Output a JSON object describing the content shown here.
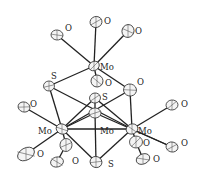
{
  "figure": {
    "type": "ORTEP molecular structure",
    "atoms": [
      {
        "id": "Mo1",
        "el": "Mo",
        "x": 94,
        "y": 66,
        "rx": 5.5,
        "ry": 4.5,
        "label": "Mo",
        "lx": 100,
        "ly": 70
      },
      {
        "id": "O1",
        "el": "O",
        "x": 57,
        "y": 35,
        "rx": 6,
        "ry": 5,
        "label": "O",
        "lx": 65,
        "ly": 31
      },
      {
        "id": "O2",
        "el": "O",
        "x": 96,
        "y": 22,
        "rx": 6,
        "ry": 5.5,
        "label": "O",
        "lx": 104,
        "ly": 24
      },
      {
        "id": "O3",
        "el": "O",
        "x": 128,
        "y": 31,
        "rx": 6,
        "ry": 6.5,
        "label": "O",
        "lx": 135,
        "ly": 34
      },
      {
        "id": "S1",
        "el": "S",
        "x": 49,
        "y": 86,
        "rx": 5.5,
        "ry": 5,
        "label": "S",
        "lx": 51,
        "ly": 79
      },
      {
        "id": "O4",
        "el": "O",
        "x": 97,
        "y": 81,
        "rx": 6,
        "ry": 6,
        "label": "O",
        "lx": 105,
        "ly": 86
      },
      {
        "id": "O5",
        "el": "O",
        "x": 130,
        "y": 90,
        "rx": 6.5,
        "ry": 6,
        "label": "O",
        "lx": 137,
        "ly": 85
      },
      {
        "id": "S2",
        "el": "S",
        "x": 95,
        "y": 98,
        "rx": 5.5,
        "ry": 5,
        "label": "S",
        "lx": 102,
        "ly": 100
      },
      {
        "id": "Mo2",
        "el": "Mo",
        "x": 62,
        "y": 129,
        "rx": 6,
        "ry": 5,
        "label": "Mo",
        "lx": 38,
        "ly": 134
      },
      {
        "id": "Mo3",
        "el": "Mo",
        "x": 95,
        "y": 113,
        "rx": 6,
        "ry": 5,
        "label": "Mo",
        "lx": 100,
        "ly": 134
      },
      {
        "id": "Mo4",
        "el": "Mo",
        "x": 132,
        "y": 129,
        "rx": 6,
        "ry": 5,
        "label": "Mo",
        "lx": 138,
        "ly": 134
      },
      {
        "id": "O6",
        "el": "O",
        "x": 24,
        "y": 107,
        "rx": 6,
        "ry": 5,
        "label": "O",
        "lx": 30,
        "ly": 107
      },
      {
        "id": "O7",
        "el": "O",
        "x": 172,
        "y": 105,
        "rx": 6,
        "ry": 5,
        "label": "O",
        "lx": 181,
        "ly": 107
      },
      {
        "id": "O8",
        "el": "O",
        "x": 26,
        "y": 154,
        "rx": 9,
        "ry": 6,
        "label": "O",
        "lx": 37,
        "ly": 157
      },
      {
        "id": "O9",
        "el": "O",
        "x": 66,
        "y": 145,
        "rx": 6,
        "ry": 6.5,
        "label": "O",
        "lx": 0,
        "ly": 0
      },
      {
        "id": "O10",
        "el": "O",
        "x": 57,
        "y": 162,
        "rx": 6.5,
        "ry": 5,
        "label": "O",
        "lx": 72,
        "ly": 164
      },
      {
        "id": "S3",
        "el": "S",
        "x": 96,
        "y": 162,
        "rx": 6,
        "ry": 5.5,
        "label": "S",
        "lx": 108,
        "ly": 167
      },
      {
        "id": "O11",
        "el": "O",
        "x": 136,
        "y": 142,
        "rx": 6.5,
        "ry": 6,
        "label": "O",
        "lx": 143,
        "ly": 146
      },
      {
        "id": "O12",
        "el": "O",
        "x": 143,
        "y": 159,
        "rx": 7,
        "ry": 5,
        "label": "O",
        "lx": 153,
        "ly": 162
      },
      {
        "id": "O13",
        "el": "O",
        "x": 172,
        "y": 147,
        "rx": 6,
        "ry": 5,
        "label": "O",
        "lx": 181,
        "ly": 146
      }
    ],
    "bonds": [
      [
        "Mo1",
        "O1"
      ],
      [
        "Mo1",
        "O2"
      ],
      [
        "Mo1",
        "O3"
      ],
      [
        "Mo1",
        "S1"
      ],
      [
        "Mo1",
        "O4"
      ],
      [
        "Mo1",
        "O5"
      ],
      [
        "S1",
        "Mo2"
      ],
      [
        "S1",
        "Mo4"
      ],
      [
        "O5",
        "Mo4"
      ],
      [
        "O5",
        "Mo2"
      ],
      [
        "S2",
        "Mo2"
      ],
      [
        "S2",
        "Mo4"
      ],
      [
        "S2",
        "Mo3"
      ],
      [
        "Mo2",
        "O6"
      ],
      [
        "Mo2",
        "O8"
      ],
      [
        "Mo2",
        "O9"
      ],
      [
        "O9",
        "O10"
      ],
      [
        "Mo2",
        "S3"
      ],
      [
        "Mo2",
        "Mo4"
      ],
      [
        "Mo3",
        "S3"
      ],
      [
        "Mo3",
        "Mo2"
      ],
      [
        "Mo4",
        "O7"
      ],
      [
        "Mo4",
        "O11"
      ],
      [
        "O11",
        "O12"
      ],
      [
        "Mo4",
        "S3"
      ],
      [
        "Mo4",
        "O13"
      ],
      [
        "Mo3",
        "O13"
      ]
    ]
  }
}
